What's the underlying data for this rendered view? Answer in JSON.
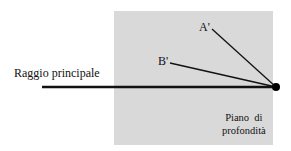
{
  "diagram": {
    "labels": {
      "main_ray": "Raggio principale",
      "point_a": "A'",
      "point_b": "B'",
      "plane_line1": "Piano  di",
      "plane_line2": "profondità"
    },
    "colors": {
      "plane": "#d9d9d9",
      "lines": "#111111",
      "background": "#ffffff"
    },
    "geometry": {
      "plane_rect": {
        "x": 114,
        "y": 11,
        "w": 159,
        "h": 134
      },
      "focal_point": {
        "x": 276,
        "y": 87
      },
      "main_ray_start": {
        "x": 42,
        "y": 87
      },
      "a_line_start": {
        "x": 212,
        "y": 29
      },
      "b_line_start": {
        "x": 170,
        "y": 63
      }
    }
  }
}
